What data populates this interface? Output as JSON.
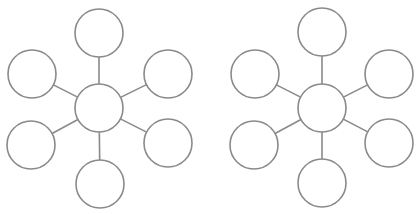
{
  "diagram": {
    "type": "spider-web-organizer",
    "stroke_color": "#8a8a8a",
    "fill_color": "#ffffff",
    "background": "#ffffff",
    "node_radius": 24,
    "stroke_width": 1.6,
    "webs": [
      {
        "name": "web-left",
        "center": {
          "x": 99,
          "y": 108
        },
        "satellites": [
          {
            "name": "top",
            "x": 99,
            "y": 33
          },
          {
            "name": "upper-right",
            "x": 168,
            "y": 74
          },
          {
            "name": "lower-right",
            "x": 168,
            "y": 143
          },
          {
            "name": "bottom",
            "x": 100,
            "y": 184
          },
          {
            "name": "lower-left",
            "x": 31,
            "y": 145
          },
          {
            "name": "upper-left",
            "x": 32,
            "y": 74
          }
        ]
      },
      {
        "name": "web-right",
        "center": {
          "x": 322,
          "y": 108
        },
        "satellites": [
          {
            "name": "top",
            "x": 322,
            "y": 32
          },
          {
            "name": "upper-right",
            "x": 389,
            "y": 74
          },
          {
            "name": "lower-right",
            "x": 389,
            "y": 143
          },
          {
            "name": "bottom",
            "x": 322,
            "y": 183
          },
          {
            "name": "lower-left",
            "x": 254,
            "y": 145
          },
          {
            "name": "upper-left",
            "x": 255,
            "y": 74
          }
        ]
      }
    ]
  }
}
